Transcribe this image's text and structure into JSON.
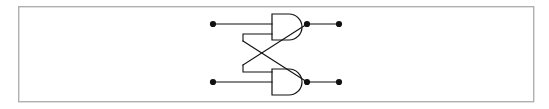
{
  "figure": {
    "background_color": "#ffffff",
    "frame": {
      "x": 18,
      "y": 6,
      "width": 515,
      "height": 95,
      "stroke_color": "#b0b0b0",
      "stroke_width": 1.4
    },
    "wire_color": "#111111",
    "gate_fill": "#ffffff"
  },
  "circuit": {
    "type": "cross-coupled-latch",
    "gate_count": 2,
    "input_terminal_count": 2,
    "output_terminal_count": 2,
    "gates": [
      {
        "id": "gate-top",
        "shape": "and",
        "x": 272,
        "y": 14,
        "width": 30,
        "height": 26,
        "output_x": 308,
        "output_y": 24,
        "has_output_node_dot": true
      },
      {
        "id": "gate-bottom",
        "shape": "and",
        "x": 272,
        "y": 69,
        "width": 30,
        "height": 26,
        "output_x": 308,
        "output_y": 82,
        "has_output_node_dot": true
      }
    ],
    "terminals": [
      {
        "id": "input-top",
        "role": "input",
        "x": 213,
        "y": 24,
        "radius": 3.1
      },
      {
        "id": "input-bottom",
        "role": "input",
        "x": 213,
        "y": 82,
        "radius": 3.1
      },
      {
        "id": "output-top",
        "role": "output",
        "x": 339,
        "y": 24,
        "radius": 3.1
      },
      {
        "id": "output-bottom",
        "role": "output",
        "x": 339,
        "y": 82,
        "radius": 3.1
      }
    ],
    "nodes": [
      {
        "id": "node-top-output",
        "x": 307,
        "y": 24,
        "radius": 3.1
      },
      {
        "id": "node-bottom-output",
        "x": 307,
        "y": 82,
        "radius": 3.1
      }
    ],
    "wires": {
      "input_top_lead": "M213,24 L272,24",
      "input_bottom_lead": "M213,82 L272,82",
      "top_gate_second_input_stub": "M272,34 L243,34 L243,41",
      "bottom_gate_second_input_stub": "M272,72 L243,72 L243,65",
      "top_output_to_terminal": "M307,24 L339,24",
      "bottom_output_to_terminal": "M307,82 L339,82",
      "cross_top_to_bottom_input": "M243,41 L307,82",
      "cross_bottom_to_top_input": "M243,65 L307,24",
      "feedback_upper_diagonal": "M307,24 L326,24",
      "feedback_lower_diagonal": "M307,82 L326,82"
    }
  },
  "labels": {
    "caption": ""
  }
}
